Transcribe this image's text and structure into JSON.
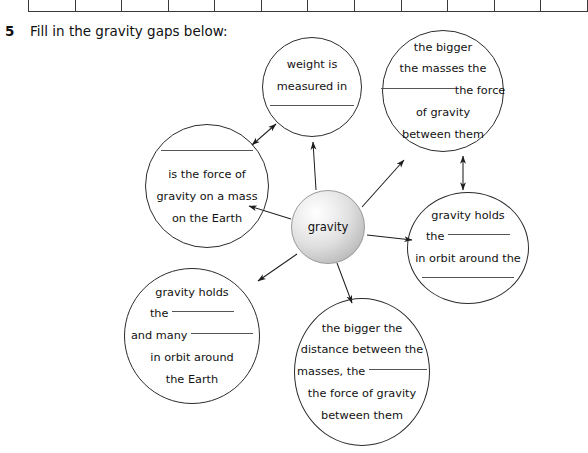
{
  "worksheet": {
    "question_number": "5",
    "question_text": "Fill in the gravity gaps below:"
  },
  "answer_table": {
    "cell_count": 12,
    "cells": [
      "",
      "",
      "",
      "",
      "",
      "",
      "",
      "",
      "",
      "",
      "",
      ""
    ]
  },
  "diagram": {
    "center_label": "gravity",
    "bubbles": {
      "weight": {
        "name": "weight-is-measured-in",
        "line1": "weight is",
        "line2": "measured in",
        "line3": ""
      },
      "masses": {
        "name": "the-bigger-the-masses",
        "line1": "the bigger",
        "line2": "the masses the",
        "line3_suffix": "the force",
        "line4": "of gravity",
        "line5": "between them"
      },
      "weight_def": {
        "name": "is-the-force-of-gravity-on-a-mass",
        "line1": "",
        "line2": "is the force of",
        "line3": "gravity on a mass",
        "line4": "on the Earth"
      },
      "moon": {
        "name": "gravity-holds-the-in-orbit-around-the",
        "line1": "gravity holds",
        "line2_prefix": "the",
        "line3": "in orbit around the",
        "line4": ""
      },
      "planets": {
        "name": "gravity-holds-the-and-many-in-orbit-around-the-earth",
        "line1": "gravity holds",
        "line2_prefix": "the",
        "line3_prefix": "and many",
        "line4": "in orbit around",
        "line5": "the Earth"
      },
      "distance": {
        "name": "the-bigger-the-distance-between-the-masses",
        "line1": "the bigger the",
        "line2": "distance between the",
        "line3_prefix": "masses, the",
        "line4": "the force of gravity",
        "line5": "between them"
      }
    },
    "connectors": [
      {
        "name": "gravity-to-weight",
        "style": "single"
      },
      {
        "name": "gravity-to-masses",
        "style": "single"
      },
      {
        "name": "gravity-to-weight-def",
        "style": "single"
      },
      {
        "name": "gravity-to-moon",
        "style": "single"
      },
      {
        "name": "gravity-to-planets",
        "style": "single"
      },
      {
        "name": "gravity-to-distance",
        "style": "single"
      },
      {
        "name": "weight-def-to-weight",
        "style": "double"
      },
      {
        "name": "masses-to-moon",
        "style": "double"
      }
    ]
  },
  "colors": {
    "ink": "#111111",
    "outline": "#2b2b2b",
    "blank_rule": "#555555",
    "sphere_edge": "#9a9a9a"
  }
}
